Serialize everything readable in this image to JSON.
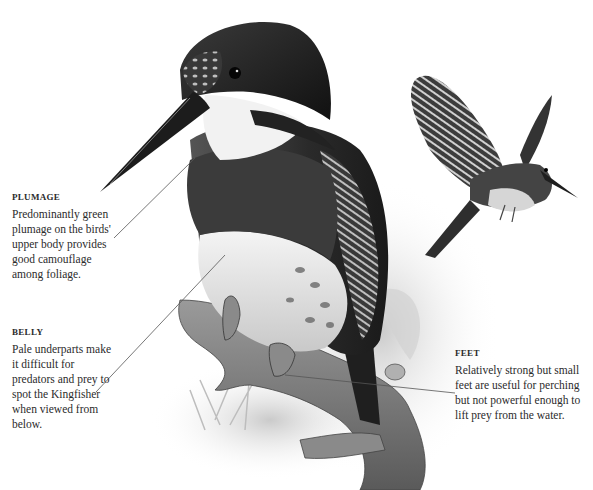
{
  "illustration": {
    "subject": "Kingfisher",
    "style": "grayscale",
    "colors": {
      "background": "#ffffff",
      "ink_dark": "#1e1e1e",
      "ink_mid": "#6a6a6a",
      "ink_light": "#c8c8c8",
      "text": "#2b2b2b"
    }
  },
  "annotations": [
    {
      "id": "plumage",
      "title": "PLUMAGE",
      "text": "Predominantly green plumage on the birds' upper body provides good camouflage among foliage."
    },
    {
      "id": "belly",
      "title": "BELLY",
      "text": "Pale underparts make it difficult for predators and prey to spot the Kingfisher when viewed from below."
    },
    {
      "id": "feet",
      "title": "FEET",
      "text": "Relatively strong but small feet are useful for perching but not powerful enough to lift prey from the water."
    }
  ]
}
